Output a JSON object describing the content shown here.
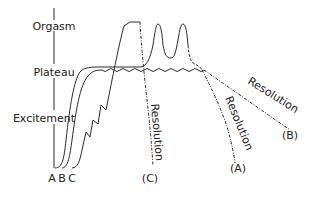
{
  "diagram": {
    "type": "sexual-response-cycle",
    "axis_labels": {
      "orgasm": "Orgasm",
      "plateau": "Plateau",
      "excitement": "Excitement"
    },
    "curve_start_labels": {
      "a": "A",
      "b": "B",
      "c": "C"
    },
    "resolution_labels": {
      "a": "Resolution",
      "b": "Resolution",
      "c": "Resolution"
    },
    "curve_end_labels": {
      "a": "(A)",
      "b": "(B)",
      "c": "(C)"
    },
    "colors": {
      "line": "#2a2a2a",
      "text": "#222222",
      "background": "#ffffff"
    }
  }
}
